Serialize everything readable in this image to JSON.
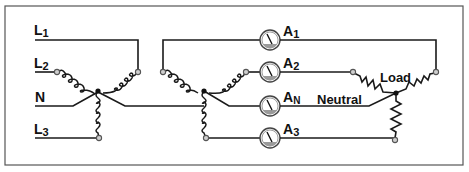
{
  "diagram": {
    "title": "",
    "type": "three-phase four-wire wye system with ammeters",
    "source_labels": [
      {
        "id": "L1",
        "main": "L",
        "sub": "1"
      },
      {
        "id": "L2",
        "main": "L",
        "sub": "2"
      },
      {
        "id": "N",
        "main": "N",
        "sub": ""
      },
      {
        "id": "L3",
        "main": "L",
        "sub": "3"
      }
    ],
    "ammeters": [
      {
        "id": "A1",
        "main": "A",
        "sub": "1"
      },
      {
        "id": "A2",
        "main": "A",
        "sub": "2"
      },
      {
        "id": "AN",
        "main": "A",
        "sub": "N"
      },
      {
        "id": "A3",
        "main": "A",
        "sub": "3"
      }
    ],
    "load_label": "Load",
    "neutral_label": "Neutral",
    "colors": {
      "line": "#1a1a1a",
      "border": "#555555",
      "node_fill": "#cfcfcf",
      "meter_ring": "#444444",
      "meter_base": "#9a9a9a"
    }
  }
}
